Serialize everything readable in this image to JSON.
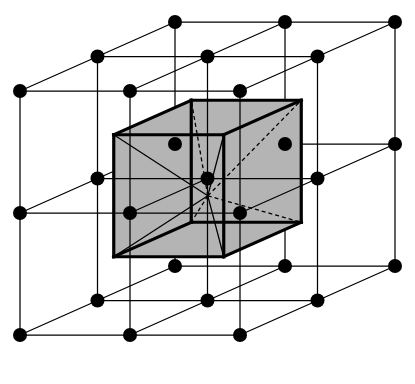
{
  "figure": {
    "title": "Cubic lattice with shaded primitive unit cell",
    "type": "crystal-lattice-diagram",
    "width": 415,
    "height": 384,
    "background_color": "#ffffff"
  },
  "style": {
    "lattice_line_color": "#000000",
    "lattice_line_width": 1.25,
    "cell_edge_color": "#000000",
    "cell_edge_width": 3.2,
    "cell_face_color": "#b4b4b4",
    "cell_face_opacity": 1,
    "node_color": "#000000",
    "node_radius": 7.0,
    "radial_solid_color": "#000000",
    "radial_solid_width": 1.3,
    "radial_dashed_color": "#000000",
    "radial_dashed_width": 1.3,
    "radial_dash_pattern": "4,3"
  },
  "projection": {
    "description": "Oblique (cabinet-like) axonometric projection of a simple cubic lattice",
    "origin": [
      20,
      335
    ],
    "axis_a_screen_delta": [
      110,
      0
    ],
    "axis_b_screen_delta": [
      0,
      -122
    ],
    "axis_c_screen_delta": [
      77.5,
      -34.5
    ]
  },
  "lattice": {
    "name": "simple cubic lattice",
    "counts": {
      "a": 3,
      "b": 3,
      "c": 3
    },
    "total_nodes": 27,
    "edge_description": "Nearest-neighbour bonds drawn along all three cubic axes"
  },
  "unit_cell": {
    "name": "shaded unit cell",
    "description": "Cube of side one lattice constant centred on the middle lattice point",
    "center_lattice_index": [
      1,
      1,
      1
    ],
    "center_screen": [
      207.8,
      195.8
    ],
    "half_side_fraction": 0.5,
    "shaded": true,
    "corner_count": 8,
    "visible_faces": [
      "top",
      "left",
      "front"
    ],
    "radial_line_count": 8,
    "radial_lines_note": "Lines from the central lattice point to the eight corners of the enclosing cube; hidden ones are dashed"
  },
  "legend": {
    "node_label": "lattice point",
    "cell_label": "unit cell",
    "bond_label": "lattice vector"
  }
}
